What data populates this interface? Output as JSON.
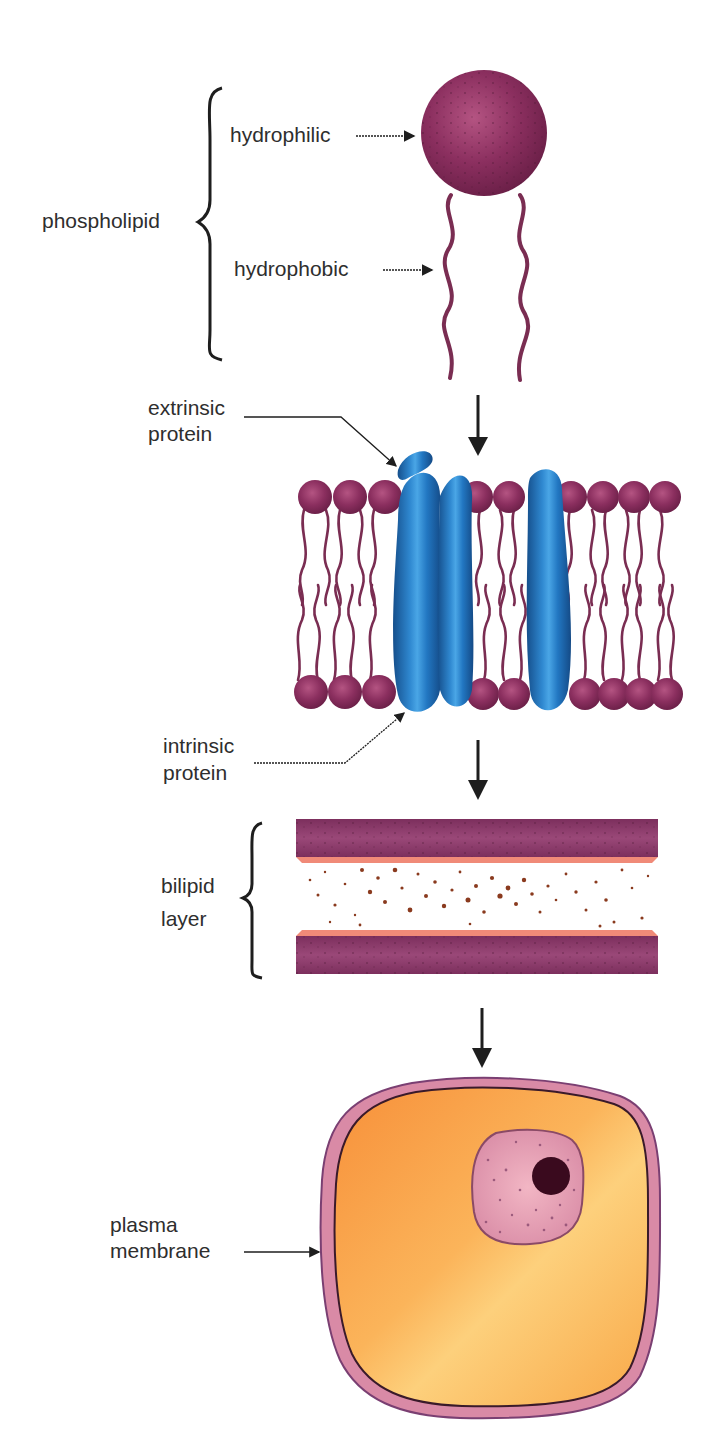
{
  "diagram": {
    "type": "biology-figure",
    "flow": "phospholipid -> membrane with proteins -> bilipid layer -> cell with plasma membrane"
  },
  "labels": {
    "phospholipid": "phospholipid",
    "hydrophilic": "hydrophilic",
    "hydrophobic": "hydrophobic",
    "extrinsic_line1": "extrinsic",
    "extrinsic_line2": "protein",
    "intrinsic_line1": "intrinsic",
    "intrinsic_line2": "protein",
    "bilipid_line1": "bilipid",
    "bilipid_line2": "layer",
    "plasma_line1": "plasma",
    "plasma_line2": "membrane"
  },
  "colors": {
    "lipid_head": "#8a2f5e",
    "lipid_head_light": "#b04f7e",
    "lipid_tail": "#7a2d52",
    "protein": "#1f6fb8",
    "protein_light": "#4aa0e0",
    "bilayer_bar": "#8a3b68",
    "bilayer_edge": "#f08070",
    "bilayer_speck": "#8a3a1e",
    "cytoplasm_dark": "#f7963a",
    "cytoplasm_light": "#fdd27a",
    "membrane": "#d98aa6",
    "membrane_dark": "#6e3c6a",
    "nucleus": "#e7a0b2",
    "nucleolus": "#3a0a1e",
    "text": "#2e2e2e",
    "arrow": "#1e1e1e"
  },
  "flow_arrows": [
    {
      "name": "arrow-1",
      "x": 478,
      "y1": 395,
      "y2": 455
    },
    {
      "name": "arrow-2",
      "x": 478,
      "y1": 740,
      "y2": 800
    },
    {
      "name": "arrow-3",
      "x": 482,
      "y1": 1008,
      "y2": 1068
    }
  ]
}
